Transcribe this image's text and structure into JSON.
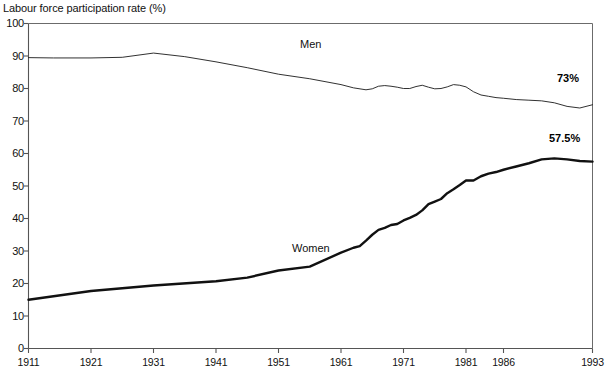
{
  "chart_data": {
    "type": "line",
    "title": "Labour force participation rate (%)",
    "xlabel": "",
    "ylabel": "Labour force participation rate (%)",
    "ylim": [
      0,
      100
    ],
    "ytick_values": [
      0,
      10,
      20,
      30,
      40,
      50,
      60,
      70,
      80,
      90,
      100
    ],
    "ytick_labels": [
      "0",
      "10",
      "20",
      "30",
      "40",
      "50",
      "60",
      "70",
      "80",
      "90",
      "100"
    ],
    "xlim": [
      1911,
      1993
    ],
    "xtick_values": [
      1911,
      1921,
      1931,
      1941,
      1951,
      1961,
      1971,
      1981,
      1986,
      1993
    ],
    "xtick_labels": [
      "1911",
      "1921",
      "1931",
      "1941",
      "1951",
      "1961",
      "1971",
      "1981",
      "1986",
      "1993"
    ],
    "grid": false,
    "legend": "inline-annotations",
    "series": [
      {
        "name": "Men",
        "label": "Men",
        "color": "#1a1a1a",
        "linewidth": 0.9,
        "end_value_label": "73%",
        "x": [
          1911,
          1915,
          1921,
          1926,
          1931,
          1936,
          1941,
          1946,
          1951,
          1956,
          1961,
          1963,
          1965,
          1966,
          1967,
          1968,
          1969,
          1970,
          1971,
          1972,
          1973,
          1974,
          1975,
          1976,
          1977,
          1978,
          1979,
          1980,
          1981,
          1982,
          1983,
          1984,
          1985,
          1986,
          1987,
          1988,
          1989,
          1990,
          1991,
          1992,
          1993
        ],
        "values": [
          89.5,
          89.4,
          89.4,
          89.6,
          90.9,
          89.8,
          88.2,
          86.4,
          84.4,
          83.0,
          81.2,
          80.2,
          79.6,
          79.9,
          80.7,
          80.9,
          80.7,
          80.4,
          80.0,
          80.0,
          80.6,
          81.0,
          80.4,
          79.9,
          80.0,
          80.5,
          81.2,
          81.0,
          80.5,
          79.0,
          78.0,
          77.6,
          77.2,
          77.0,
          76.6,
          76.4,
          76.2,
          75.6,
          74.5,
          74.0,
          75.0
        ]
      },
      {
        "name": "Women",
        "label": "Women",
        "color": "#111111",
        "linewidth": 2.4,
        "end_value_label": "57.5%",
        "x": [
          1911,
          1921,
          1931,
          1941,
          1946,
          1951,
          1956,
          1961,
          1963,
          1964,
          1965,
          1966,
          1967,
          1968,
          1969,
          1970,
          1971,
          1972,
          1973,
          1974,
          1975,
          1976,
          1977,
          1978,
          1979,
          1980,
          1981,
          1982,
          1983,
          1984,
          1985,
          1986,
          1987,
          1988,
          1989,
          1990,
          1991,
          1992,
          1993
        ],
        "values": [
          15.0,
          17.7,
          19.4,
          20.7,
          21.8,
          24.0,
          25.2,
          29.5,
          31.0,
          31.5,
          33.2,
          35.0,
          36.5,
          37.1,
          38.0,
          38.3,
          39.4,
          40.2,
          41.1,
          42.5,
          44.4,
          45.2,
          46.0,
          47.8,
          49.0,
          50.3,
          51.7,
          51.7,
          53.0,
          53.8,
          54.3,
          55.0,
          56.0,
          57.0,
          58.2,
          58.5,
          58.2,
          57.7,
          57.5
        ]
      }
    ],
    "annotations": [
      {
        "text": "Men",
        "series": "Men"
      },
      {
        "text": "Women",
        "series": "Women"
      },
      {
        "text": "73%",
        "series": "Men"
      },
      {
        "text": "57.5%",
        "series": "Women"
      }
    ],
    "axis_color": "#555555",
    "background": "#ffffff"
  }
}
